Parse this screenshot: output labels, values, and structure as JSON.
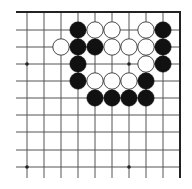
{
  "board": {
    "type": "go-diagram-corner",
    "corner": "top-right",
    "colors": {
      "background": "#ffffff",
      "line": "#555555",
      "border": "#222222",
      "black_stone": "#111111",
      "white_stone_fill": "#ffffff",
      "white_stone_stroke": "#333333",
      "star_point": "#222222"
    },
    "geometry": {
      "col_x": [
        27,
        44,
        61,
        78,
        95,
        112,
        129,
        146,
        163
      ],
      "row_y": [
        30,
        47,
        64,
        81,
        98,
        115,
        132,
        150,
        167
      ],
      "top_edge_y": 12,
      "right_edge_x": 180,
      "line_start_x": 16,
      "line_end_y": 178,
      "stone_radius": 8.2
    },
    "star_points": [
      {
        "col": 0,
        "row": 2
      },
      {
        "col": 6,
        "row": 2
      },
      {
        "col": 0,
        "row": 8
      },
      {
        "col": 6,
        "row": 8
      }
    ],
    "stones": [
      {
        "color": "black",
        "col": 3,
        "row": 0
      },
      {
        "color": "white",
        "col": 4,
        "row": 0
      },
      {
        "color": "white",
        "col": 5,
        "row": 0
      },
      {
        "color": "white",
        "col": 7,
        "row": 0
      },
      {
        "color": "black",
        "col": 8,
        "row": 0
      },
      {
        "color": "white",
        "col": 2,
        "row": 1
      },
      {
        "color": "black",
        "col": 3,
        "row": 1
      },
      {
        "color": "black",
        "col": 4,
        "row": 1
      },
      {
        "color": "white",
        "col": 5,
        "row": 1
      },
      {
        "color": "white",
        "col": 6,
        "row": 1
      },
      {
        "color": "white",
        "col": 7,
        "row": 1
      },
      {
        "color": "black",
        "col": 8,
        "row": 1
      },
      {
        "color": "black",
        "col": 3,
        "row": 2
      },
      {
        "color": "white",
        "col": 7,
        "row": 2
      },
      {
        "color": "black",
        "col": 8,
        "row": 2
      },
      {
        "color": "black",
        "col": 3,
        "row": 3
      },
      {
        "color": "white",
        "col": 4,
        "row": 3
      },
      {
        "color": "white",
        "col": 5,
        "row": 3
      },
      {
        "color": "white",
        "col": 6,
        "row": 3
      },
      {
        "color": "black",
        "col": 7,
        "row": 3
      },
      {
        "color": "black",
        "col": 4,
        "row": 4
      },
      {
        "color": "black",
        "col": 5,
        "row": 4
      },
      {
        "color": "black",
        "col": 6,
        "row": 4
      },
      {
        "color": "black",
        "col": 7,
        "row": 4
      }
    ]
  }
}
